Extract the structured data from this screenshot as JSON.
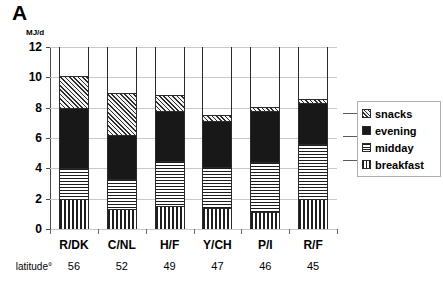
{
  "figure": {
    "panel_label": "A",
    "axis_unit": "MJ/d",
    "latitude_row_label": "latitude°"
  },
  "chart_data": {
    "type": "bar",
    "subtype": "stacked-vertical",
    "title": "A",
    "xlabel": "",
    "ylabel": "MJ/d",
    "ylim": [
      0,
      12
    ],
    "yticks": [
      0,
      2,
      4,
      6,
      8,
      10,
      12
    ],
    "ytick_labels": [
      "0",
      "2",
      "4",
      "6",
      "8",
      "10",
      "12"
    ],
    "grid": "horizontal",
    "legend_position": "right",
    "categories": [
      "R/DK",
      "C/NL",
      "H/F",
      "Y/CH",
      "P/I",
      "R/F"
    ],
    "secondary_axis": {
      "label": "latitude°",
      "values": [
        "56",
        "52",
        "49",
        "47",
        "46",
        "45"
      ]
    },
    "series": [
      {
        "name": "breakfast",
        "pattern": "vertical-lines",
        "values": [
          2.0,
          1.3,
          1.5,
          1.4,
          1.1,
          2.0
        ]
      },
      {
        "name": "midday",
        "pattern": "horizontal-lines",
        "values": [
          2.0,
          2.0,
          3.0,
          2.7,
          3.3,
          3.6
        ]
      },
      {
        "name": "evening",
        "pattern": "solid-black",
        "values": [
          4.0,
          2.9,
          3.3,
          3.0,
          3.4,
          2.7
        ]
      },
      {
        "name": "snacks",
        "pattern": "diagonal-hatch",
        "values": [
          2.1,
          2.8,
          1.05,
          0.45,
          0.25,
          0.3
        ]
      }
    ],
    "totals": [
      10.1,
      9.0,
      8.85,
      7.55,
      8.05,
      8.6
    ]
  },
  "legend": {
    "items": [
      {
        "label": "snacks",
        "swatch": "diagonal-hatch-swatch"
      },
      {
        "label": "evening",
        "swatch": "solid-black-swatch"
      },
      {
        "label": "midday",
        "swatch": "horizontal-lines-swatch"
      },
      {
        "label": "breakfast",
        "swatch": "vertical-lines-swatch"
      }
    ]
  },
  "colors": {
    "axis": "#4a4a4a",
    "gridline": "#c9c9c9",
    "evening_fill": "#181818",
    "snacks_fill": "#f2f2f2",
    "hatch_stroke": "#1d1d1d",
    "background": "#ffffff"
  }
}
